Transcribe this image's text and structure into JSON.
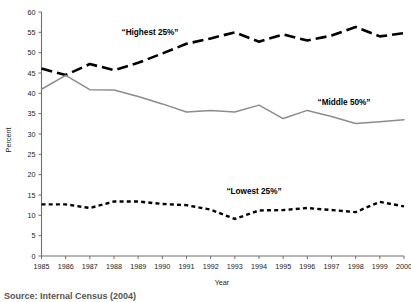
{
  "chart_data": {
    "type": "line",
    "title": "",
    "xlabel": "Year",
    "ylabel": "Percent",
    "ylim": [
      0,
      60
    ],
    "ytick_step": 5,
    "yticks": [
      0,
      5,
      10,
      15,
      20,
      25,
      30,
      35,
      40,
      45,
      50,
      55,
      60
    ],
    "grid": false,
    "legend_position": "inline-annotations",
    "categories": [
      "1985",
      "1986",
      "1987",
      "1988",
      "1989",
      "1990",
      "1991",
      "1992",
      "1993",
      "1994",
      "1995",
      "1996",
      "1997",
      "1998",
      "1999",
      "2000"
    ],
    "x": [
      1985,
      1986,
      1987,
      1988,
      1989,
      1990,
      1991,
      1992,
      1993,
      1994,
      1995,
      1996,
      1997,
      1998,
      1999,
      2000
    ],
    "series": [
      {
        "name": "“Highest 25%”",
        "style": "long-dash",
        "color": "#000000",
        "values": [
          46.1,
          44.5,
          47.2,
          45.7,
          47.5,
          49.8,
          52.2,
          53.5,
          55.0,
          52.7,
          54.5,
          53.0,
          54.2,
          56.3,
          54.0,
          54.8
        ]
      },
      {
        "name": "“Middle 50%”",
        "style": "solid",
        "color": "#8c8c8c",
        "values": [
          41.0,
          44.4,
          40.9,
          40.8,
          39.2,
          37.4,
          35.4,
          35.8,
          35.4,
          37.1,
          33.8,
          35.8,
          34.3,
          32.6,
          33.0,
          33.5
        ]
      },
      {
        "name": "“Lowest 25%”",
        "style": "short-dash",
        "color": "#000000",
        "values": [
          12.7,
          12.7,
          11.8,
          13.4,
          13.4,
          12.8,
          12.5,
          11.4,
          9.1,
          11.2,
          11.3,
          11.8,
          11.3,
          10.8,
          13.3,
          12.2
        ]
      }
    ],
    "annotations": [
      {
        "text": "“Highest 25%”",
        "x_px": 150,
        "y_px": 35
      },
      {
        "text": "“Middle 50%”",
        "x_px": 344,
        "y_px": 105
      },
      {
        "text": "“Lowest 25%”",
        "x_px": 254,
        "y_px": 194
      }
    ]
  },
  "axes": {
    "y_title": "Percent",
    "x_title": "Year",
    "y_tick_labels": [
      "60",
      "55",
      "50",
      "45",
      "40",
      "35",
      "30",
      "25",
      "20",
      "15",
      "10",
      "5",
      "0"
    ],
    "x_tick_labels": [
      "1985",
      "1986",
      "1987",
      "1988",
      "1989",
      "1990",
      "1991",
      "1992",
      "1993",
      "1994",
      "1995",
      "1996",
      "1997",
      "1998",
      "1999",
      "2000"
    ]
  },
  "footer": {
    "source_note": "Source: Internal Census (2004)"
  }
}
